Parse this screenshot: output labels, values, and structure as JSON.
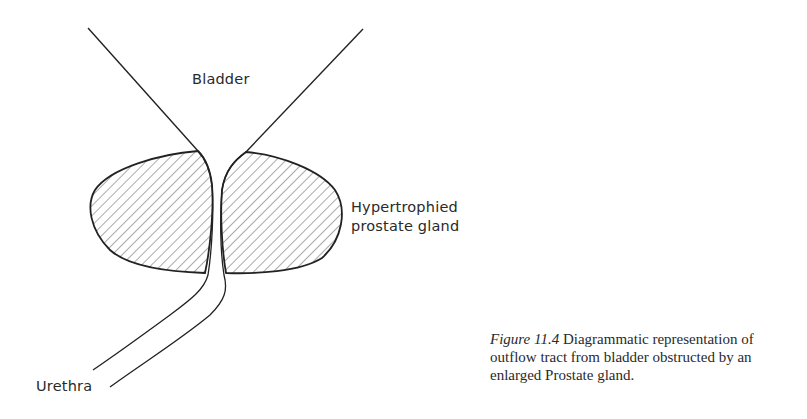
{
  "diagram": {
    "labels": {
      "bladder": "Bladder",
      "prostate_line1": "Hypertrophied",
      "prostate_line2": "prostate gland",
      "urethra": "Urethra"
    },
    "caption": {
      "figure_number": "Figure 11.4",
      "text": " Diagrammatic representation of outflow tract from bladder obstructed by an enlarged Prostate gland."
    },
    "colors": {
      "stroke": "#222222",
      "hatch": "#555555",
      "background": "#ffffff"
    }
  }
}
